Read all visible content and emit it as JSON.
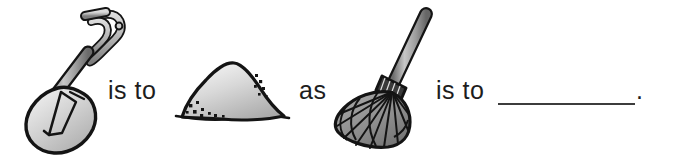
{
  "page": {
    "type": "visual-analogy-worksheet",
    "background_color": "#ffffff",
    "ink_color": "#1d1d1d",
    "width": 674,
    "height": 159
  },
  "analogy": {
    "relation_label_1": "is to",
    "connector_label": "as",
    "relation_label_2": "is to",
    "terminator": ".",
    "answer_blank_value": ""
  },
  "figures": {
    "term_a": {
      "name": "shovel",
      "icon": "shovel-icon",
      "alt": "a round-point shovel with a D-grip handle"
    },
    "term_b": {
      "name": "dirt pile",
      "icon": "dirt-pile-icon",
      "alt": "a mound of dirt or sand with speckles"
    },
    "term_c": {
      "name": "rake",
      "icon": "rake-icon",
      "alt": "a fan rake with spreading tines"
    },
    "term_d": {
      "name": "blank",
      "icon": "answer-blank",
      "alt": "an empty answer line for the student"
    }
  },
  "colors": {
    "outline": "#141414",
    "metal_light": "#e8e8e8",
    "metal_mid": "#b4b4b4",
    "metal_dark": "#7d7d7d",
    "pile_light": "#f0f0f0",
    "pile_mid": "#c2c2c2",
    "pile_dark": "#9a9a9a",
    "rake_fill": "#8e8e8e",
    "line": "#3c3c3c"
  }
}
